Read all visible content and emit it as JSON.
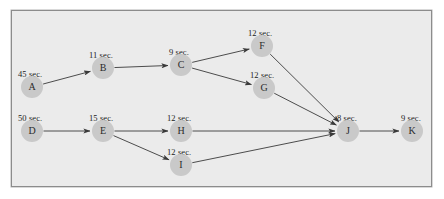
{
  "diagram": {
    "background_color": "#ebebeb",
    "border_color": "#8c8c8c",
    "node_color": "#c9c9c9",
    "edge_color": "#3a3a3a",
    "nodes": [
      {
        "id": "A",
        "label": "A",
        "duration": "45 sec.",
        "cx": 32,
        "cy": 87,
        "label_x": 18,
        "label_y": 70
      },
      {
        "id": "B",
        "label": "B",
        "duration": "11 sec.",
        "cx": 103,
        "cy": 68,
        "label_x": 89,
        "label_y": 51
      },
      {
        "id": "C",
        "label": "C",
        "duration": "9 sec.",
        "cx": 181,
        "cy": 65,
        "label_x": 169,
        "label_y": 48
      },
      {
        "id": "F",
        "label": "F",
        "duration": "12 sec.",
        "cx": 262,
        "cy": 46,
        "label_x": 248,
        "label_y": 29
      },
      {
        "id": "G",
        "label": "G",
        "duration": "12 sec.",
        "cx": 264,
        "cy": 88,
        "label_x": 250,
        "label_y": 71
      },
      {
        "id": "D",
        "label": "D",
        "duration": "50 sec.",
        "cx": 32,
        "cy": 131,
        "label_x": 18,
        "label_y": 114
      },
      {
        "id": "E",
        "label": "E",
        "duration": "15 sec.",
        "cx": 103,
        "cy": 131,
        "label_x": 89,
        "label_y": 114
      },
      {
        "id": "H",
        "label": "H",
        "duration": "12 sec.",
        "cx": 181,
        "cy": 131,
        "label_x": 167,
        "label_y": 114
      },
      {
        "id": "I",
        "label": "I",
        "duration": "12 sec.",
        "cx": 181,
        "cy": 165,
        "label_x": 167,
        "label_y": 148
      },
      {
        "id": "J",
        "label": "J",
        "duration": "8 sec.",
        "cx": 348,
        "cy": 131,
        "label_x": 337,
        "label_y": 114
      },
      {
        "id": "K",
        "label": "K",
        "duration": "9 sec.",
        "cx": 412,
        "cy": 131,
        "label_x": 401,
        "label_y": 114
      }
    ],
    "edges": [
      {
        "from": "A",
        "to": "B"
      },
      {
        "from": "B",
        "to": "C"
      },
      {
        "from": "C",
        "to": "F"
      },
      {
        "from": "C",
        "to": "G"
      },
      {
        "from": "F",
        "to": "J"
      },
      {
        "from": "G",
        "to": "J"
      },
      {
        "from": "D",
        "to": "E"
      },
      {
        "from": "E",
        "to": "H"
      },
      {
        "from": "E",
        "to": "I"
      },
      {
        "from": "H",
        "to": "J"
      },
      {
        "from": "I",
        "to": "J"
      },
      {
        "from": "J",
        "to": "K"
      }
    ]
  }
}
